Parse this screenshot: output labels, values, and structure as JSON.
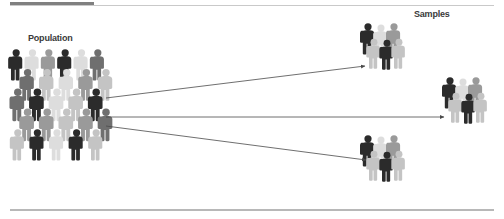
{
  "canvas": {
    "width": 504,
    "height": 219,
    "background": "#ffffff"
  },
  "rules": {
    "top_accent": {
      "x": 10,
      "y": 2,
      "width": 84,
      "height": 4,
      "color": "#808080"
    },
    "top_line": {
      "x": 10,
      "y": 5,
      "width": 484,
      "height": 1,
      "color": "#c9c9c9"
    },
    "bottom_line": {
      "x": 10,
      "y": 209,
      "width": 484,
      "height": 2,
      "color": "#b8b8b8"
    }
  },
  "labels": {
    "population": "Population",
    "samples": "Samples"
  },
  "palette": {
    "figure_dark": "#2b2b2b",
    "figure_mid_dark": "#6f6f6f",
    "figure_mid": "#9a9a9a",
    "figure_light": "#c4c4c4",
    "figure_pale": "#dddddd",
    "arrow": "#4a4a4a",
    "text": "#3a3a3a"
  },
  "population": {
    "label": "Population",
    "bounds": {
      "x": 8,
      "y": 48,
      "width": 98,
      "height": 128
    },
    "figure_count": 22,
    "rows": [
      {
        "y": 52,
        "scale": 1.0,
        "shades": [
          "figure_dark",
          "figure_pale",
          "figure_mid",
          "figure_dark",
          "figure_pale",
          "figure_mid_dark"
        ]
      },
      {
        "y": 72,
        "scale": 1.02,
        "shades": [
          "figure_mid_dark",
          "figure_light",
          "figure_pale",
          "figure_mid",
          "figure_light"
        ]
      },
      {
        "y": 92,
        "scale": 1.04,
        "shades": [
          "figure_mid_dark",
          "figure_dark",
          "figure_pale",
          "figure_light",
          "figure_dark"
        ]
      },
      {
        "y": 112,
        "scale": 1.04,
        "shades": [
          "figure_mid",
          "figure_mid",
          "figure_light",
          "figure_mid",
          "figure_mid_dark"
        ]
      },
      {
        "y": 132,
        "scale": 1.0,
        "shades": [
          "figure_light",
          "figure_dark",
          "figure_pale",
          "figure_dark",
          "figure_light"
        ]
      }
    ]
  },
  "samples": {
    "label": "Samples",
    "groups": [
      {
        "id": "sample-top",
        "x": 368,
        "y": 24,
        "figure_count": 6
      },
      {
        "id": "sample-right",
        "x": 450,
        "y": 78,
        "figure_count": 6
      },
      {
        "id": "sample-bottom",
        "x": 368,
        "y": 136,
        "figure_count": 6
      }
    ],
    "group_shades": [
      "figure_dark",
      "figure_pale",
      "figure_mid",
      "figure_light",
      "figure_dark",
      "figure_light"
    ]
  },
  "arrows": [
    {
      "id": "arrow-to-top",
      "x1": 106,
      "y1": 98,
      "x2": 365,
      "y2": 66
    },
    {
      "id": "arrow-to-right",
      "x1": 106,
      "y1": 117,
      "x2": 444,
      "y2": 117
    },
    {
      "id": "arrow-to-bottom",
      "x1": 106,
      "y1": 126,
      "x2": 366,
      "y2": 160
    }
  ]
}
